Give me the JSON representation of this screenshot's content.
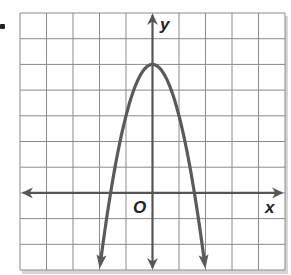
{
  "figure": {
    "type": "parabola-graph",
    "axis_labels": {
      "x": "x",
      "y": "y",
      "origin": "O"
    },
    "grid": {
      "x_range": [
        -5,
        5
      ],
      "y_range": [
        -3,
        7
      ],
      "step": 1
    },
    "curve": {
      "equation": "y = -2x^2 + 5",
      "a": -2,
      "b": 0,
      "c": 5,
      "vertex": [
        0,
        5
      ],
      "opens": "down",
      "y_min_shown": -3
    },
    "colors": {
      "grid": "#8a8a8a",
      "axis": "#555555",
      "curve": "#5a5a5a",
      "frame_shadow": "#c8c8c8"
    }
  }
}
